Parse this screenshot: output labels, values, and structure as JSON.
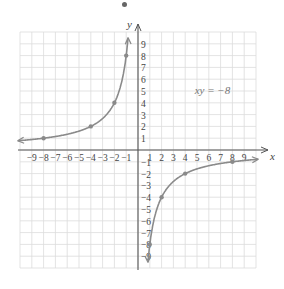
{
  "chart_data": {
    "type": "line",
    "title": "",
    "equation_label": "xy = −8",
    "xlabel": "x",
    "ylabel": "y",
    "xlim": [
      -10,
      10
    ],
    "ylim": [
      -10,
      10
    ],
    "grid": true,
    "x_ticks": [
      "-9",
      "-8",
      "-7",
      "-6",
      "-5",
      "-4",
      "-3",
      "-2",
      "-1",
      "1",
      "2",
      "3",
      "4",
      "5",
      "6",
      "7",
      "8",
      "9"
    ],
    "y_ticks": [
      "9",
      "8",
      "7",
      "6",
      "5",
      "4",
      "3",
      "2",
      "1",
      "-1",
      "-2",
      "-3",
      "-4",
      "-5",
      "-6",
      "-7",
      "-8",
      "-9"
    ],
    "series": [
      {
        "name": "xy = -8 (branch x<0)",
        "points": [
          [
            -8,
            1
          ],
          [
            -4,
            2
          ],
          [
            -2,
            4
          ],
          [
            -1,
            8
          ]
        ]
      },
      {
        "name": "xy = -8 (branch x>0)",
        "points": [
          [
            1,
            -8
          ],
          [
            2,
            -4
          ],
          [
            4,
            -2
          ],
          [
            8,
            -1
          ]
        ]
      }
    ],
    "colors": {
      "curve": "#8a8a8a",
      "grid": "#dcdcdc",
      "axis": "#555555",
      "text": "#444444"
    }
  }
}
